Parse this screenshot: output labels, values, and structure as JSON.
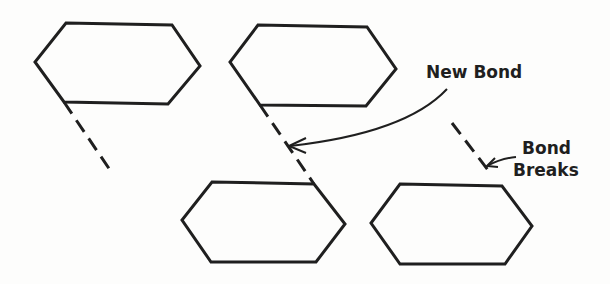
{
  "diagram": {
    "labels": {
      "new_bond": "New Bond",
      "bond_breaks_line1": "Bond",
      "bond_breaks_line2": "Breaks"
    },
    "colors": {
      "stroke": "#1f1f1f",
      "background": "#fdfdfc"
    },
    "panels": [
      {
        "name": "before",
        "description": "hexagon with dangling dashed bond"
      },
      {
        "name": "new-bond",
        "description": "two hexagons joined by dashed new bond"
      },
      {
        "name": "bond-breaks",
        "description": "dashed bond separated from hexagon"
      }
    ]
  }
}
